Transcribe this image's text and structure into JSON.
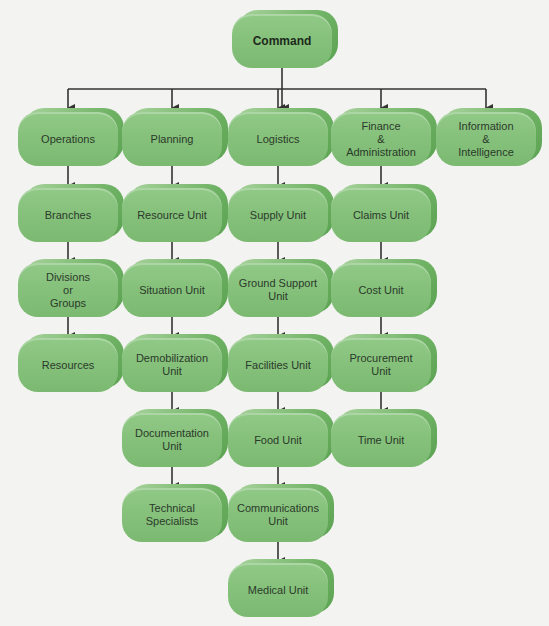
{
  "diagram": {
    "type": "org-chart",
    "colors": {
      "box_fill": "#84c07a",
      "box_side": "#6fb264",
      "line": "#333333",
      "background": "#f3f3f1"
    },
    "root": {
      "id": "command",
      "label": "Command"
    },
    "columns": [
      {
        "id": "operations",
        "label": "Operations",
        "children": [
          "Branches",
          "Divisions\nor\nGroups",
          "Resources"
        ]
      },
      {
        "id": "planning",
        "label": "Planning",
        "children": [
          "Resource Unit",
          "Situation Unit",
          "Demobilization\nUnit",
          "Documentation\nUnit",
          "Technical\nSpecialists"
        ]
      },
      {
        "id": "logistics",
        "label": "Logistics",
        "children": [
          "Supply Unit",
          "Ground Support\nUnit",
          "Facilities Unit",
          "Food Unit",
          "Communications\nUnit",
          "Medical Unit"
        ]
      },
      {
        "id": "finance",
        "label": "Finance\n&\nAdministration",
        "children": [
          "Claims Unit",
          "Cost Unit",
          "Procurement\nUnit",
          "Time Unit"
        ]
      },
      {
        "id": "information",
        "label": "Information\n&\nIntelligence",
        "children": []
      }
    ]
  }
}
